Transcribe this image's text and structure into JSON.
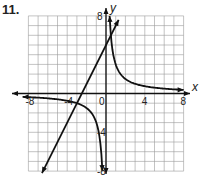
{
  "problem_number": "11.",
  "chart_data": {
    "type": "line",
    "title": "",
    "xlabel": "x",
    "ylabel": "y",
    "xlim": [
      -8,
      8
    ],
    "ylim": [
      -8,
      8
    ],
    "grid": true,
    "x_tick_labels": [
      "-8",
      "-4",
      "0",
      "4",
      "8"
    ],
    "y_tick_labels": [
      "8",
      "4",
      "-4",
      "-8"
    ],
    "series": [
      {
        "name": "line",
        "equation": "y = 2x + 5",
        "points": [
          [
            -6.5,
            -8
          ],
          [
            1.5,
            8
          ]
        ]
      },
      {
        "name": "hyperbola",
        "equation": "y = 3/x",
        "branches": 2
      }
    ]
  }
}
